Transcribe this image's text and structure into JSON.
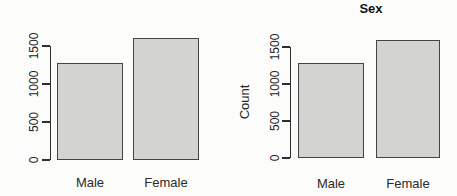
{
  "page": {
    "background": "#fcfcfa"
  },
  "colors": {
    "bar_fill": "#d3d4d1",
    "bar_border": "#454545",
    "axis": "#2e2e2e",
    "text": "#242424",
    "title": "#151515"
  },
  "chart_data": [
    {
      "type": "bar",
      "title": "",
      "xlabel": "",
      "ylabel": "",
      "categories": [
        "Male",
        "Female"
      ],
      "values": [
        1280,
        1600
      ],
      "yticks": [
        0,
        500,
        1000,
        1500
      ],
      "ylim": [
        0,
        1700
      ],
      "grid": false,
      "legend": null
    },
    {
      "type": "bar",
      "title": "Sex",
      "xlabel": "",
      "ylabel": "Count",
      "categories": [
        "Male",
        "Female"
      ],
      "values": [
        1280,
        1600
      ],
      "yticks": [
        0,
        500,
        1000,
        1500
      ],
      "ylim": [
        0,
        1700
      ],
      "grid": false,
      "legend": null
    }
  ]
}
